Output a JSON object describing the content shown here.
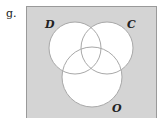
{
  "problem": {
    "label": "g."
  },
  "diagram": {
    "type": "venn",
    "universe_fill": "#d4d4d4",
    "universe_stroke": "#9a9a9a",
    "circle_fill": "#ffffff",
    "circle_stroke": "#a8a8a8",
    "sets": [
      {
        "name": "D",
        "label": "D"
      },
      {
        "name": "C",
        "label": "C"
      },
      {
        "name": "O",
        "label": "O"
      }
    ]
  }
}
